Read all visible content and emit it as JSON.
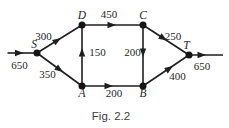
{
  "figure": {
    "caption": "Fig. 2.2"
  },
  "diagram": {
    "type": "directed-network-flow",
    "nodes": [
      {
        "id": "S",
        "label": "S"
      },
      {
        "id": "D",
        "label": "D"
      },
      {
        "id": "C",
        "label": "C"
      },
      {
        "id": "T",
        "label": "T"
      },
      {
        "id": "A",
        "label": "A"
      },
      {
        "id": "B",
        "label": "B"
      }
    ],
    "edges": [
      {
        "from": "external",
        "to": "S",
        "label": "650"
      },
      {
        "from": "S",
        "to": "D",
        "label": "300"
      },
      {
        "from": "S",
        "to": "A",
        "label": "350"
      },
      {
        "from": "D",
        "to": "C",
        "label": "450"
      },
      {
        "from": "A",
        "to": "D",
        "label": "150"
      },
      {
        "from": "C",
        "to": "B",
        "label": "200"
      },
      {
        "from": "A",
        "to": "B",
        "label": "200"
      },
      {
        "from": "C",
        "to": "T",
        "label": "250"
      },
      {
        "from": "B",
        "to": "T",
        "label": "400"
      },
      {
        "from": "T",
        "to": "external",
        "label": "650"
      }
    ]
  },
  "colors": {
    "ink": "#1f1f1f",
    "caption_text": "#3d3d3d",
    "background": "#ffffff"
  }
}
